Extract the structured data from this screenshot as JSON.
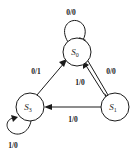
{
  "diagram": {
    "type": "state-transition-diagram",
    "title": "",
    "colors": {
      "stroke": "#1a1a1a",
      "node_fill": "#ffffff",
      "background": "#ffffff"
    },
    "states": [
      {
        "id": "S0",
        "label": "S",
        "subscript": "0",
        "position": "top",
        "cx": 77,
        "cy": 52,
        "r": 14
      },
      {
        "id": "S3",
        "label": "S",
        "subscript": "3",
        "position": "bottom-left",
        "cx": 30,
        "cy": 107,
        "r": 14
      },
      {
        "id": "S1",
        "label": "S",
        "subscript": "1",
        "position": "bottom-right",
        "cx": 115,
        "cy": 107,
        "r": 14
      }
    ],
    "transitions": [
      {
        "id": "t1",
        "from": "S0",
        "to": "S0",
        "label": "0/0",
        "kind": "self-loop",
        "label_x": 71,
        "label_y": 13
      },
      {
        "id": "t2",
        "from": "S3",
        "to": "S0",
        "label": "0/1",
        "kind": "edge",
        "label_x": 36,
        "label_y": 72
      },
      {
        "id": "t3",
        "from": "S0",
        "to": "S1",
        "label": "0/0",
        "kind": "edge",
        "label_x": 111,
        "label_y": 72
      },
      {
        "id": "t4",
        "from": "S1",
        "to": "S0",
        "label": "1/0",
        "kind": "edge",
        "label_x": 80,
        "label_y": 83
      },
      {
        "id": "t5",
        "from": "S1",
        "to": "S3",
        "label": "1/0",
        "kind": "edge",
        "label_x": 73,
        "label_y": 120
      },
      {
        "id": "t6",
        "from": "S3",
        "to": "S3",
        "label": "1/0",
        "kind": "self-loop",
        "label_x": 13,
        "label_y": 146
      }
    ]
  }
}
